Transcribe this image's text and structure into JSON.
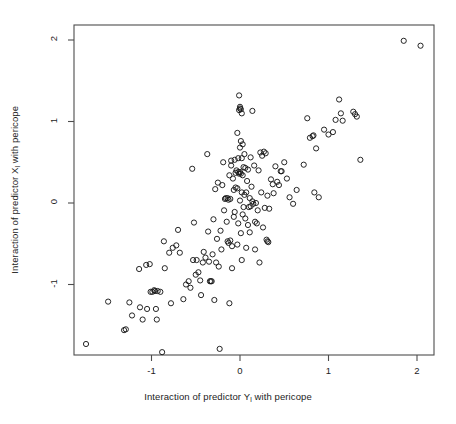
{
  "chart_data": {
    "type": "scatter",
    "title": "",
    "xlabel": "Interaction of predictor Y",
    "xlabel_sub": "l",
    "xlabel_tail": " with pericope",
    "xlabel_full": "Interaction of predictor Yl with pericope",
    "ylabel": "Interaction of predictor X",
    "ylabel_sub": "l",
    "ylabel_tail": " with pericope",
    "ylabel_full": "Interaction of predictor Xl with pericope",
    "xticks": [
      -1,
      0,
      1,
      2
    ],
    "xtick_labels": [
      "-1",
      "0",
      "1",
      "2"
    ],
    "yticks": [
      -1,
      0,
      1,
      2
    ],
    "ytick_labels": [
      "-1",
      "0",
      "1",
      "2"
    ],
    "xlim": [
      -1.88,
      2.19
    ],
    "ylim": [
      -1.84,
      2.19
    ],
    "grid": false,
    "legend": null,
    "marker": "open-circle",
    "marker_color": "#1a1a1a",
    "marker_fill": "none",
    "marker_radius_px": 2.6,
    "n_points": 185,
    "points": [
      [
        -1.74,
        -1.73
      ],
      [
        -1.49,
        -1.21
      ],
      [
        -1.31,
        -1.56
      ],
      [
        -1.29,
        -1.55
      ],
      [
        -1.25,
        -1.22
      ],
      [
        -1.22,
        -1.38
      ],
      [
        -1.14,
        -0.81
      ],
      [
        -1.13,
        -1.28
      ],
      [
        -1.1,
        -1.43
      ],
      [
        -1.06,
        -0.76
      ],
      [
        -1.05,
        -1.3
      ],
      [
        -1.02,
        -0.75
      ],
      [
        -1.01,
        -1.09
      ],
      [
        -0.99,
        -1.09
      ],
      [
        -0.97,
        -1.07
      ],
      [
        -0.96,
        -1.08
      ],
      [
        -0.95,
        -1.3
      ],
      [
        -0.94,
        -1.43
      ],
      [
        -0.93,
        -1.08
      ],
      [
        -0.9,
        -1.09
      ],
      [
        -0.88,
        -1.83
      ],
      [
        -0.86,
        -0.47
      ],
      [
        -0.85,
        -0.8
      ],
      [
        -0.8,
        -0.61
      ],
      [
        -0.78,
        -1.23
      ],
      [
        -0.76,
        -0.55
      ],
      [
        -0.72,
        -0.52
      ],
      [
        -0.7,
        -0.33
      ],
      [
        -0.68,
        -0.61
      ],
      [
        -0.64,
        -1.18
      ],
      [
        -0.61,
        -1.0
      ],
      [
        -0.58,
        -0.96
      ],
      [
        -0.56,
        -1.04
      ],
      [
        -0.54,
        0.42
      ],
      [
        -0.53,
        -0.7
      ],
      [
        -0.52,
        -0.24
      ],
      [
        -0.5,
        -0.88
      ],
      [
        -0.49,
        -0.7
      ],
      [
        -0.47,
        -0.85
      ],
      [
        -0.45,
        -0.95
      ],
      [
        -0.44,
        -1.13
      ],
      [
        -0.42,
        -0.73
      ],
      [
        -0.41,
        -0.6
      ],
      [
        -0.39,
        -0.67
      ],
      [
        -0.37,
        0.6
      ],
      [
        -0.36,
        -0.35
      ],
      [
        -0.35,
        -0.72
      ],
      [
        -0.34,
        -0.96
      ],
      [
        -0.33,
        -0.96
      ],
      [
        -0.32,
        -0.96
      ],
      [
        -0.31,
        -0.63
      ],
      [
        -0.3,
        -0.2
      ],
      [
        -0.29,
        -1.19
      ],
      [
        -0.28,
        0.17
      ],
      [
        -0.27,
        -0.73
      ],
      [
        -0.26,
        -0.44
      ],
      [
        -0.25,
        0.25
      ],
      [
        -0.24,
        -0.78
      ],
      [
        -0.23,
        -1.79
      ],
      [
        -0.22,
        -0.34
      ],
      [
        -0.21,
        -0.57
      ],
      [
        -0.2,
        0.22
      ],
      [
        -0.19,
        0.5
      ],
      [
        -0.18,
        -0.09
      ],
      [
        -0.17,
        0.05
      ],
      [
        -0.16,
        0.06
      ],
      [
        -0.15,
        -0.23
      ],
      [
        -0.14,
        0.06
      ],
      [
        -0.14,
        -0.47
      ],
      [
        -0.13,
        0.04
      ],
      [
        -0.13,
        -0.49
      ],
      [
        -0.12,
        0.34
      ],
      [
        -0.12,
        -1.23
      ],
      [
        -0.11,
        0.05
      ],
      [
        -0.11,
        -0.46
      ],
      [
        -0.1,
        0.46
      ],
      [
        -0.1,
        0.52
      ],
      [
        -0.09,
        -0.53
      ],
      [
        -0.09,
        -0.8
      ],
      [
        -0.08,
        0.3
      ],
      [
        -0.07,
        0.16
      ],
      [
        -0.07,
        -0.17
      ],
      [
        -0.06,
        0.53
      ],
      [
        -0.06,
        -0.11
      ],
      [
        -0.05,
        0.37
      ],
      [
        -0.05,
        0.19
      ],
      [
        -0.04,
        0.4
      ],
      [
        -0.03,
        0.86
      ],
      [
        -0.03,
        0.18
      ],
      [
        -0.03,
        -0.51
      ],
      [
        -0.02,
        0.55
      ],
      [
        -0.02,
        0.38
      ],
      [
        -0.02,
        -0.25
      ],
      [
        -0.01,
        1.32
      ],
      [
        -0.01,
        1.14
      ],
      [
        -0.01,
        0.36
      ],
      [
        0.0,
        1.18
      ],
      [
        0.0,
        1.16
      ],
      [
        0.0,
        0.68
      ],
      [
        0.0,
        0.38
      ],
      [
        0.0,
        0.03
      ],
      [
        0.01,
        1.15
      ],
      [
        0.01,
        0.76
      ],
      [
        0.01,
        0.36
      ],
      [
        0.01,
        -0.37
      ],
      [
        0.02,
        1.1
      ],
      [
        0.02,
        0.55
      ],
      [
        0.02,
        0.13
      ],
      [
        0.02,
        -0.7
      ],
      [
        0.03,
        0.72
      ],
      [
        0.03,
        0.34
      ],
      [
        0.03,
        -0.14
      ],
      [
        0.04,
        0.44
      ],
      [
        0.04,
        -0.05
      ],
      [
        0.05,
        0.6
      ],
      [
        0.05,
        0.1
      ],
      [
        0.06,
        0.43
      ],
      [
        0.06,
        -0.19
      ],
      [
        0.07,
        0.13
      ],
      [
        0.07,
        -0.55
      ],
      [
        0.08,
        0.27
      ],
      [
        0.09,
        0.41
      ],
      [
        0.09,
        -0.27
      ],
      [
        0.1,
        -0.05
      ],
      [
        0.11,
        0.06
      ],
      [
        0.11,
        -0.36
      ],
      [
        0.12,
        0.56
      ],
      [
        0.12,
        -0.04
      ],
      [
        0.13,
        0.2
      ],
      [
        0.14,
        1.13
      ],
      [
        0.14,
        0.02
      ],
      [
        0.15,
        -0.01
      ],
      [
        0.16,
        0.46
      ],
      [
        0.17,
        -0.23
      ],
      [
        0.17,
        -0.57
      ],
      [
        0.18,
        0.0
      ],
      [
        0.19,
        -0.25
      ],
      [
        0.2,
        -0.09
      ],
      [
        0.21,
        0.4
      ],
      [
        0.22,
        -0.73
      ],
      [
        0.23,
        0.62
      ],
      [
        0.24,
        0.13
      ],
      [
        0.25,
        0.58
      ],
      [
        0.26,
        -0.3
      ],
      [
        0.27,
        0.63
      ],
      [
        0.28,
        -0.06
      ],
      [
        0.29,
        0.61
      ],
      [
        0.3,
        -0.45
      ],
      [
        0.31,
        0.09
      ],
      [
        0.31,
        -0.47
      ],
      [
        0.32,
        -0.48
      ],
      [
        0.33,
        -0.07
      ],
      [
        0.35,
        0.29
      ],
      [
        0.37,
        0.23
      ],
      [
        0.38,
        0.12
      ],
      [
        0.4,
        0.45
      ],
      [
        0.42,
        0.26
      ],
      [
        0.44,
        0.22
      ],
      [
        0.46,
        0.39
      ],
      [
        0.47,
        0.39
      ],
      [
        0.5,
        0.5
      ],
      [
        0.53,
        0.3
      ],
      [
        0.56,
        0.07
      ],
      [
        0.6,
        -0.01
      ],
      [
        0.64,
        0.16
      ],
      [
        0.72,
        0.47
      ],
      [
        0.76,
        1.04
      ],
      [
        0.79,
        0.8
      ],
      [
        0.82,
        0.82
      ],
      [
        0.83,
        0.83
      ],
      [
        0.84,
        0.13
      ],
      [
        0.86,
        0.67
      ],
      [
        0.89,
        0.07
      ],
      [
        0.95,
        0.9
      ],
      [
        1.0,
        0.84
      ],
      [
        1.05,
        0.87
      ],
      [
        1.08,
        1.02
      ],
      [
        1.12,
        1.27
      ],
      [
        1.14,
        1.1
      ],
      [
        1.16,
        1.01
      ],
      [
        1.28,
        1.12
      ],
      [
        1.3,
        1.09
      ],
      [
        1.32,
        1.06
      ],
      [
        1.36,
        0.53
      ],
      [
        1.85,
        1.99
      ],
      [
        2.04,
        1.93
      ]
    ]
  },
  "figure": {
    "background": "#ffffff",
    "frame_color": "#4d4d4d",
    "text_color": "#1c1c1c"
  }
}
